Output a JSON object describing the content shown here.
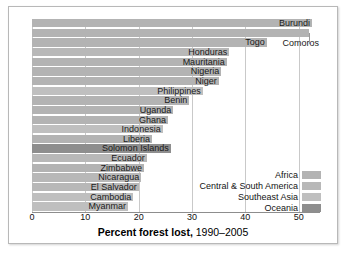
{
  "chart_data": {
    "type": "bar",
    "orientation": "horizontal",
    "title": "Percent forest lost, 1990–2005",
    "title_bold_part": "Percent forest lost,",
    "title_normal_part": " 1990–2005",
    "xlabel": "Percent forest lost, 1990–2005",
    "ylabel": "",
    "xlim": [
      0,
      54
    ],
    "xticks": [
      0,
      10,
      20,
      30,
      40,
      50
    ],
    "xticklabels": [
      "0",
      "10",
      "20",
      "30",
      "40",
      "50"
    ],
    "grid": "vertical",
    "legend_position": "lower-right-inside",
    "categories": [
      "Burundi",
      "Comoros",
      "Togo",
      "Honduras",
      "Mauritania",
      "Nigeria",
      "Niger",
      "Philippines",
      "Benin",
      "Uganda",
      "Ghana",
      "Indonesia",
      "Liberia",
      "Solomon Islands",
      "Ecuador",
      "Zimbabwe",
      "Nicaragua",
      "El Salvador",
      "Cambodia",
      "Myanmar"
    ],
    "values": [
      52.5,
      52.0,
      44.0,
      37.0,
      36.5,
      35.5,
      35.0,
      32.0,
      29.5,
      26.5,
      25.5,
      24.5,
      22.5,
      26.0,
      21.5,
      21.0,
      20.5,
      20.0,
      19.0,
      18.0
    ],
    "groups": [
      "Africa",
      "Africa",
      "Africa",
      "Central & South America",
      "Africa",
      "Africa",
      "Africa",
      "Southeast Asia",
      "Africa",
      "Africa",
      "Africa",
      "Southeast Asia",
      "Africa",
      "Oceania",
      "Central & South America",
      "Africa",
      "Central & South America",
      "Central & South America",
      "Southeast Asia",
      "Southeast Asia"
    ],
    "label_offsets": [
      52.5,
      52.0,
      44.0,
      37.0,
      36.5,
      35.5,
      35.0,
      32.0,
      29.5,
      26.5,
      25.5,
      24.5,
      22.5,
      26.0,
      21.5,
      21.0,
      20.5,
      20.0,
      19.0,
      18.0
    ],
    "legend": [
      {
        "label": "Africa",
        "color": "#b3b3b3"
      },
      {
        "label": "Central & South America",
        "color": "#b8b8b8"
      },
      {
        "label": "Southeast Asia",
        "color": "#bfbfbf"
      },
      {
        "label": "Oceania",
        "color": "#8e8e8e"
      }
    ],
    "colors": {
      "africa": "#b3b3b3",
      "central_south_america": "#b8b8b8",
      "southeast_asia": "#bfbfbf",
      "oceania": "#8e8e8e",
      "gridline": "#c9c9c9",
      "axis": "#8d8d8d",
      "text": "#111111",
      "frame": "#b8b8b8",
      "background": "#ffffff"
    }
  }
}
